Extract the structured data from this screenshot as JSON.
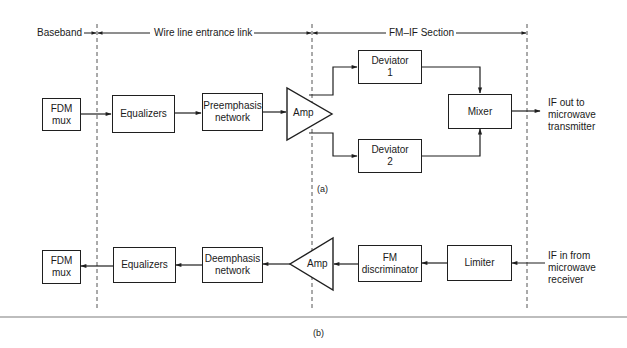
{
  "header": {
    "baseband": "Baseband",
    "wire_line": "Wire line entrance link",
    "fm_if": "FM–IF Section"
  },
  "diagram_a": {
    "caption": "(a)",
    "blocks": {
      "fdm_mux": "FDM\nmux",
      "equalizers": "Equalizers",
      "preemphasis": "Preemphasis\nnetwork",
      "amp": "Amp",
      "deviator1": "Deviator\n1",
      "deviator2": "Deviator\n2",
      "mixer": "Mixer"
    },
    "output_label": "IF out to\nmicrowave\ntransmitter"
  },
  "diagram_b": {
    "caption": "(b)",
    "blocks": {
      "fdm_mux": "FDM\nmux",
      "equalizers": "Equalizers",
      "deemphasis": "Deemphasis\nnetwork",
      "amp": "Amp",
      "fm_discriminator": "FM\ndiscriminator",
      "limiter": "Limiter"
    },
    "input_label": "IF in from\nmicrowave\nreceiver"
  }
}
